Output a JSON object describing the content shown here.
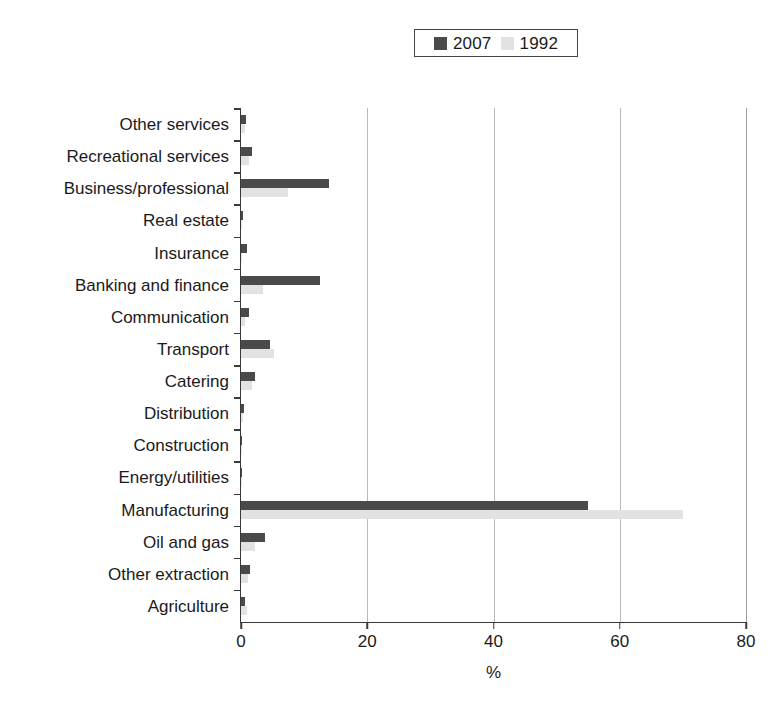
{
  "chart_data": {
    "type": "bar",
    "orientation": "horizontal",
    "title": "",
    "xlabel": "%",
    "ylabel": "",
    "xlim": [
      0,
      80
    ],
    "xticks": [
      0,
      20,
      40,
      60,
      80
    ],
    "grid": true,
    "legend_position": "top-center",
    "categories": [
      "Other services",
      "Recreational services",
      "Business/professional",
      "Real estate",
      "Insurance",
      "Banking and finance",
      "Communication",
      "Transport",
      "Catering",
      "Distribution",
      "Construction",
      "Energy/utilities",
      "Manufacturing",
      "Oil and gas",
      "Other extraction",
      "Agriculture"
    ],
    "series": [
      {
        "name": "2007",
        "color": "#4a4a4a",
        "values": [
          0.8,
          1.7,
          14.0,
          0.3,
          0.9,
          12.5,
          1.3,
          4.6,
          2.2,
          0.4,
          0.2,
          0.1,
          55.0,
          3.8,
          1.4,
          0.7
        ]
      },
      {
        "name": "1992",
        "color": "#e2e2e2",
        "values": [
          0.6,
          1.2,
          7.5,
          0.2,
          0.1,
          3.5,
          0.7,
          5.3,
          1.8,
          0.3,
          0.1,
          0.1,
          70.0,
          2.2,
          1.1,
          0.9
        ]
      }
    ]
  },
  "legend": {
    "entries": [
      {
        "label": "2007",
        "swatch": "legend-swatch-2007"
      },
      {
        "label": "1992",
        "swatch": "legend-swatch-1992"
      }
    ]
  },
  "axis": {
    "x_title": "%",
    "x_tick_labels": [
      "0",
      "20",
      "40",
      "60",
      "80"
    ]
  }
}
